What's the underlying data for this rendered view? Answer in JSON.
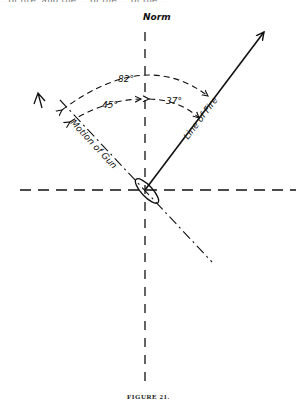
{
  "page": {
    "top_text_fragment": "...of fire, and the ... of the ... of the ..."
  },
  "diagram": {
    "north_label": "Norm",
    "line_of_fire_label": "Line of Fire",
    "motion_of_gun_label": "Motion of Gun",
    "angles": {
      "total": "82°",
      "motion_side": "45°",
      "fire_side": "37°"
    },
    "caption": "FIGURE 21."
  }
}
